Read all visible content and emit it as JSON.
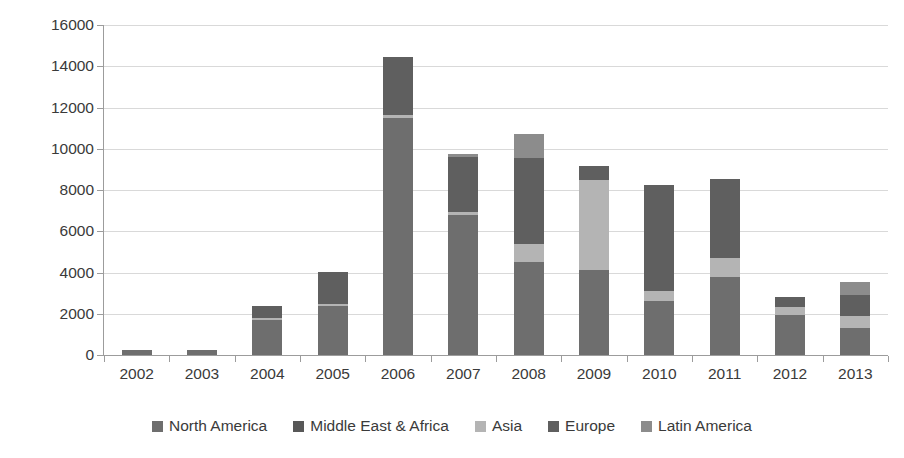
{
  "chart_data": {
    "type": "bar",
    "subtype": "stacked-vertical",
    "title": "",
    "subtitle": "",
    "xlabel": "",
    "ylabel": "",
    "ylim": [
      0,
      16000
    ],
    "ytick_step": 2000,
    "ytick_labels": [
      "16000",
      "14000",
      "12000",
      "10000",
      "8000",
      "6000",
      "4000",
      "2000",
      "0"
    ],
    "ytick_values": [
      16000,
      14000,
      12000,
      10000,
      8000,
      6000,
      4000,
      2000,
      0
    ],
    "grid": true,
    "grid_axis": "y",
    "legend_position": "bottom",
    "categories": [
      "2002",
      "2003",
      "2004",
      "2005",
      "2006",
      "2007",
      "2008",
      "2009",
      "2010",
      "2011",
      "2012",
      "2013"
    ],
    "series": [
      {
        "name": "North America",
        "color": "#6e6e6e",
        "values": [
          230,
          220,
          1700,
          2400,
          11500,
          6800,
          4500,
          4100,
          2600,
          3800,
          1950,
          1300
        ]
      },
      {
        "name": "Middle East & Africa",
        "color": "#585858",
        "values": [
          0,
          0,
          0,
          0,
          0,
          0,
          0,
          0,
          0,
          0,
          0,
          0
        ]
      },
      {
        "name": "Asia",
        "color": "#b4b4b4",
        "values": [
          0,
          0,
          100,
          80,
          120,
          130,
          900,
          4400,
          480,
          900,
          400,
          600
        ]
      },
      {
        "name": "Europe",
        "color": "#5f5f5f",
        "values": [
          0,
          0,
          600,
          1550,
          2830,
          2670,
          4150,
          650,
          5170,
          3850,
          450,
          1000
        ]
      },
      {
        "name": "Latin America",
        "color": "#8c8c8c",
        "values": [
          0,
          0,
          0,
          0,
          0,
          150,
          1150,
          0,
          0,
          0,
          0,
          650
        ]
      }
    ],
    "totals": [
      230,
      220,
      2400,
      4030,
      14450,
      9750,
      10700,
      9150,
      8250,
      8550,
      2800,
      3550
    ],
    "axis_color": "#9c9c9c",
    "gridline_color": "#d9d9d9",
    "background": "#ffffff"
  },
  "legend": {
    "items": [
      {
        "label": "North America",
        "color": "#6e6e6e"
      },
      {
        "label": "Middle East & Africa",
        "color": "#585858"
      },
      {
        "label": "Asia",
        "color": "#b4b4b4"
      },
      {
        "label": "Europe",
        "color": "#5f5f5f"
      },
      {
        "label": "Latin America",
        "color": "#8c8c8c"
      }
    ]
  }
}
